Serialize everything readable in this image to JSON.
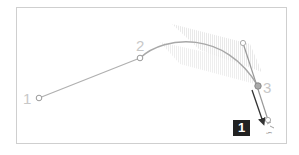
{
  "diagram": {
    "point_labels": [
      "1",
      "2",
      "3"
    ],
    "step_badge": "1",
    "colors": {
      "frame": "#cfcfcf",
      "path": "#aaaaaa",
      "handle": "#888888",
      "arrow": "#333333",
      "badge_bg": "#222222",
      "badge_text": "#ffffff",
      "label": "#c8c8c8"
    }
  }
}
